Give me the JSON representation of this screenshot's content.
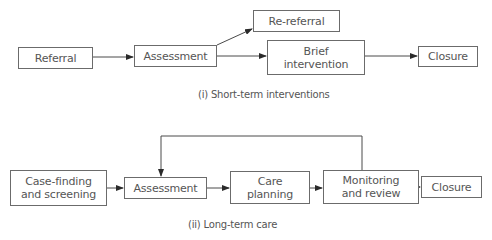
{
  "diagram": {
    "short_term": {
      "caption": "(i) Short-term interventions",
      "nodes": {
        "referral": "Referral",
        "assessment": "Assessment",
        "re_referral": "Re-referral",
        "brief_intervention_line1": "Brief",
        "brief_intervention_line2": "intervention",
        "closure": "Closure"
      },
      "edges": [
        [
          "Referral",
          "Assessment"
        ],
        [
          "Assessment",
          "Re-referral"
        ],
        [
          "Assessment",
          "Brief intervention"
        ],
        [
          "Brief intervention",
          "Closure"
        ]
      ]
    },
    "long_term": {
      "caption": "(ii) Long-term care",
      "nodes": {
        "case_finding_line1": "Case-finding",
        "case_finding_line2": "and screening",
        "assessment": "Assessment",
        "care_planning_line1": "Care",
        "care_planning_line2": "planning",
        "monitoring_line1": "Monitoring",
        "monitoring_line2": "and review",
        "closure": "Closure"
      },
      "edges": [
        [
          "Case-finding and screening",
          "Assessment"
        ],
        [
          "Assessment",
          "Care planning"
        ],
        [
          "Care planning",
          "Monitoring and review"
        ],
        [
          "Monitoring and review",
          "Closure"
        ],
        [
          "Monitoring and review",
          "Assessment"
        ]
      ]
    },
    "colors": {
      "line": "#3a3a3a",
      "box_border": "#6b6b6b",
      "text": "#555555",
      "background": "#ffffff"
    }
  }
}
